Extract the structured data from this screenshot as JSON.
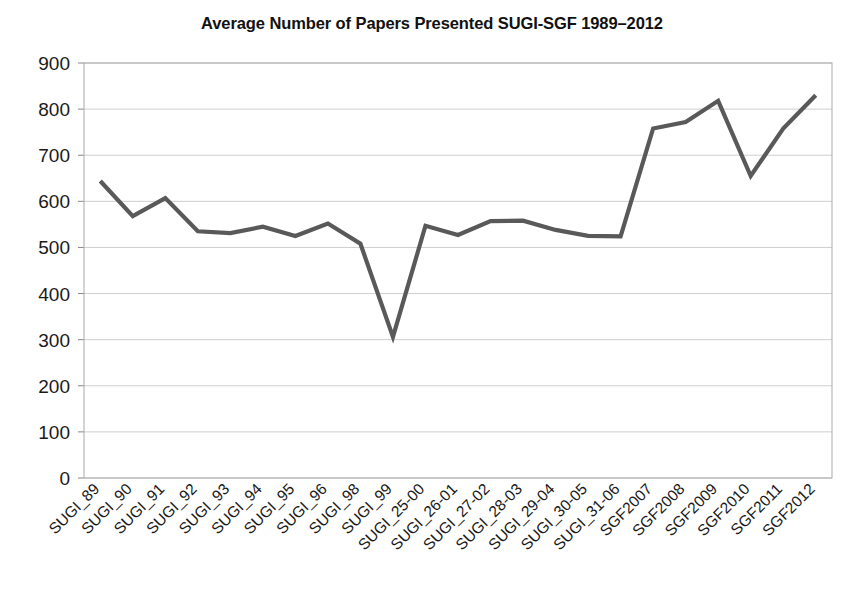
{
  "chart_data": {
    "type": "line",
    "title": "Average Number of Papers Presented SUGI-SGF 1989–2012",
    "xlabel": "",
    "ylabel": "",
    "ylim": [
      0,
      900
    ],
    "yticks": [
      0,
      100,
      200,
      300,
      400,
      500,
      600,
      700,
      800,
      900
    ],
    "grid": true,
    "legend": "none",
    "line_color": "#595959",
    "categories": [
      "SUGI_89",
      "SUGI_90",
      "SUGI_91",
      "SUGI_92",
      "SUGI_93",
      "SUGI_94",
      "SUGI_95",
      "SUGI_96",
      "SUGI_98",
      "SUGI_99",
      "SUGI_25-00",
      "SUGI_26-01",
      "SUGI_27-02",
      "SUGI_28-03",
      "SUGI_29-04",
      "SUGI_30-05",
      "SUGI_31-06",
      "SGF2007",
      "SGF2008",
      "SGF2009",
      "SGF2010",
      "SGF2011",
      "SGF2012"
    ],
    "values": [
      644,
      568,
      607,
      535,
      531,
      545,
      525,
      552,
      508,
      306,
      547,
      527,
      557,
      558,
      538,
      525,
      524,
      758,
      772,
      818,
      655,
      758,
      830
    ]
  },
  "axes": {
    "ytick_labels": [
      "900",
      "800",
      "700",
      "600",
      "500",
      "400",
      "300",
      "200",
      "100",
      "0"
    ]
  }
}
